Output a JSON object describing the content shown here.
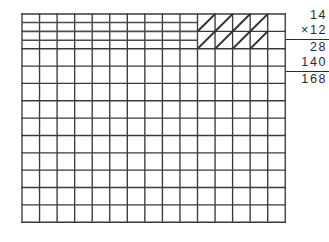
{
  "figure": {
    "name": "area-model-multiplication-grid"
  },
  "grid": {
    "columns": 15,
    "rows": 12,
    "origin_x": 22,
    "origin_y": 14,
    "cell_width": 17.55,
    "cell_height": 17.35,
    "line_color": "#3a3a3a",
    "line_width": 1.35,
    "background": "#ffffff"
  },
  "hatched_region": {
    "label": "hatched-block",
    "start_column": 11,
    "column_span": 4,
    "start_row": 1,
    "row_span": 2,
    "hatch_direction": "bottom-left-to-top-right",
    "hatch_color": "#2f2f2f"
  },
  "drawn_rows": {
    "label": "traced-row-lines",
    "rows": [
      1,
      2,
      3
    ],
    "start_column": 1,
    "end_column": 10,
    "line_color": "#4a4a4a"
  },
  "calculation": {
    "name": "long-multiplication",
    "multiplicand": "14",
    "multiplier": "×12",
    "partial_product_1": "28",
    "partial_product_2": "140",
    "product": "168"
  }
}
